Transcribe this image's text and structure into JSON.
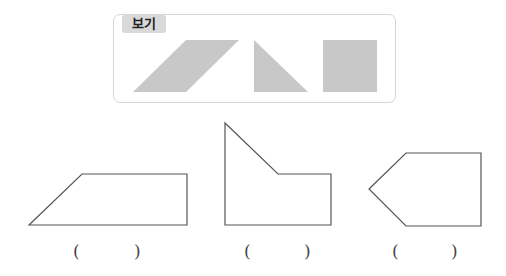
{
  "example": {
    "label": "보기",
    "pieces": [
      "parallelogram",
      "right-triangle",
      "square"
    ],
    "fill_color": "#c8c8c8"
  },
  "problems": [
    {
      "open": "(",
      "close": ")",
      "shape": "trapezoid"
    },
    {
      "open": "(",
      "close": ")",
      "shape": "l-shape-with-diagonal"
    },
    {
      "open": "(",
      "close": ")",
      "shape": "pentagon-arrow"
    }
  ]
}
